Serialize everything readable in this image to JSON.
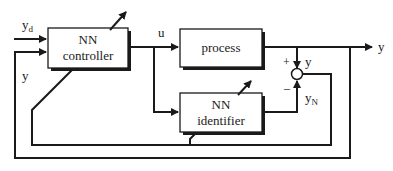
{
  "diagram": {
    "type": "block-diagram",
    "blocks": {
      "controller": {
        "line1": "NN",
        "line2": "controller"
      },
      "process": {
        "label": "process"
      },
      "identifier": {
        "line1": "NN",
        "line2": "identifier"
      }
    },
    "signals": {
      "reference": {
        "base": "y",
        "sub": "d"
      },
      "feedback_y": "y",
      "control_u": "u",
      "output_y": "y",
      "sum_input_y": "y",
      "identifier_output": {
        "base": "y",
        "sub": "N"
      }
    },
    "summing_junction": {
      "plus": "+",
      "minus": "–"
    },
    "colors": {
      "line": "#1a1a1a",
      "background": "#ffffff"
    }
  }
}
